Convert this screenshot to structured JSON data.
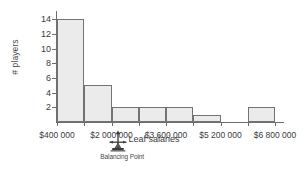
{
  "chart_data": {
    "type": "bar",
    "title": "",
    "xlabel": "Leaf salaries",
    "ylabel": "# players",
    "categories": [
      "$400 000 - $1 200 000",
      "$1 200 000 - $2 000 000",
      "$2 000 000 - $2 800 000",
      "$2 800 000 - $3 600 000",
      "$3 600 000 - $4 400 000",
      "$4 400 000 - $5 200 000",
      "$5 200 000 - $6 000 000",
      "$6 000 000 - $6 800 000"
    ],
    "values": [
      14,
      5,
      2,
      2,
      2,
      1,
      0,
      2
    ],
    "bin_edges": [
      400000,
      1200000,
      2000000,
      2800000,
      3600000,
      4400000,
      5200000,
      6000000,
      6800000
    ],
    "bin_width": 800000,
    "xtick_labels": [
      "$400 000",
      "$2 000 000",
      "$3 600 000",
      "$5 200 000",
      "$6 800 000"
    ],
    "xtick_values": [
      400000,
      2000000,
      3600000,
      5200000,
      6800000
    ],
    "ytick_labels": [
      "2",
      "4",
      "6",
      "8",
      "10",
      "12",
      "14"
    ],
    "ytick_values": [
      2,
      4,
      6,
      8,
      10,
      12,
      14
    ],
    "ylim": [
      0,
      15
    ],
    "xlim": [
      400000,
      6800000
    ],
    "grid": false,
    "legend": false,
    "bar_fill_color": "#ebebeb",
    "bar_edge_color": "#737373",
    "axis_color": "#6e6e6e",
    "text_color": "#3b3b3b"
  },
  "annotation": {
    "balancing_point_label": "Balancing Point",
    "balancing_point_icon": "fulcrum-arrow-icon",
    "balancing_point_value": 2200000
  }
}
